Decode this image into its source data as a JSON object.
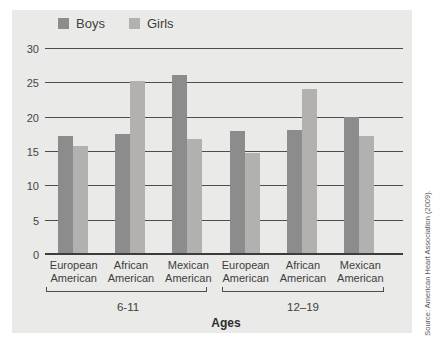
{
  "legend": {
    "items": [
      {
        "label": "Boys",
        "color": "#8c8c8c"
      },
      {
        "label": "Girls",
        "color": "#b2b1af"
      }
    ]
  },
  "axis": {
    "y_ticks": [
      0,
      5,
      10,
      15,
      20,
      25,
      30
    ],
    "x_title": "Ages"
  },
  "age_groups": [
    {
      "label": "6-11",
      "ethnicities": [
        "European American",
        "African American",
        "Mexican American"
      ]
    },
    {
      "label": "12–19",
      "ethnicities": [
        "European American",
        "African American",
        "Mexican American"
      ]
    }
  ],
  "source": "Source: American Heart Association (2009).",
  "chart_data": {
    "type": "bar",
    "title": "",
    "categories": [
      "European American (6-11)",
      "African American (6-11)",
      "Mexican American (6-11)",
      "European American (12–19)",
      "African American (12–19)",
      "Mexican American (12–19)"
    ],
    "series": [
      {
        "name": "Boys",
        "color": "#8c8c8c",
        "values": [
          17.0,
          17.3,
          25.9,
          17.8,
          17.9,
          19.8
        ]
      },
      {
        "name": "Girls",
        "color": "#b2b1af",
        "values": [
          15.6,
          25.1,
          16.6,
          14.5,
          23.9,
          17.1
        ]
      }
    ],
    "xlabel": "Ages",
    "ylabel": "",
    "ylim": [
      0,
      30
    ],
    "yticks": [
      0,
      5,
      10,
      15,
      20,
      25,
      30
    ],
    "grid": true,
    "legend_position": "top"
  }
}
